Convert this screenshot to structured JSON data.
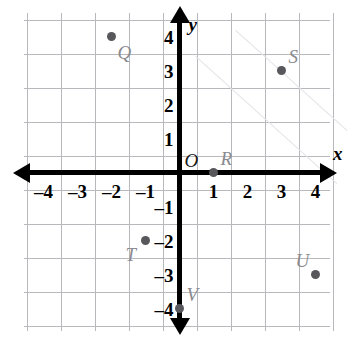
{
  "figure": {
    "type": "coordinate-plane",
    "width": 351,
    "height": 343,
    "background_color": "#ffffff"
  },
  "chart_data": {
    "type": "scatter",
    "title": "",
    "xlabel": "x",
    "ylabel": "y",
    "xlim": [
      -4.5,
      4.5
    ],
    "ylim": [
      -4.5,
      4.5
    ],
    "grid": true,
    "grid_color": "#b8b8bc",
    "axis_color": "#000000",
    "point_color": "#58585c",
    "label_color": "#8a8a90",
    "xticks": [
      -4,
      -3,
      -2,
      -1,
      1,
      2,
      3,
      4
    ],
    "yticks": [
      4,
      3,
      2,
      1,
      -1,
      -2,
      -3,
      -4
    ],
    "xtick_labels": [
      "–4",
      "–3",
      "–2",
      "–1",
      "1",
      "2",
      "3",
      "4"
    ],
    "ytick_labels": [
      "4",
      "3",
      "2",
      "1",
      "–1",
      "–2",
      "–3",
      "–4"
    ],
    "points": [
      {
        "label": "Q",
        "x": -2,
        "y": 4,
        "label_pos": "below-right"
      },
      {
        "label": "S",
        "x": 3,
        "y": 3,
        "label_pos": "above-right"
      },
      {
        "label": "R",
        "x": 1,
        "y": 0,
        "label_pos": "above-right"
      },
      {
        "label": "T",
        "x": -1,
        "y": -2,
        "label_pos": "below-left"
      },
      {
        "label": "U",
        "x": 4,
        "y": -3,
        "label_pos": "above-left"
      },
      {
        "label": "V",
        "x": 0,
        "y": -4,
        "label_pos": "above-right"
      }
    ],
    "origin_label": "O"
  },
  "axes": {
    "x_name": "x",
    "y_name": "y",
    "origin_label": "O"
  }
}
